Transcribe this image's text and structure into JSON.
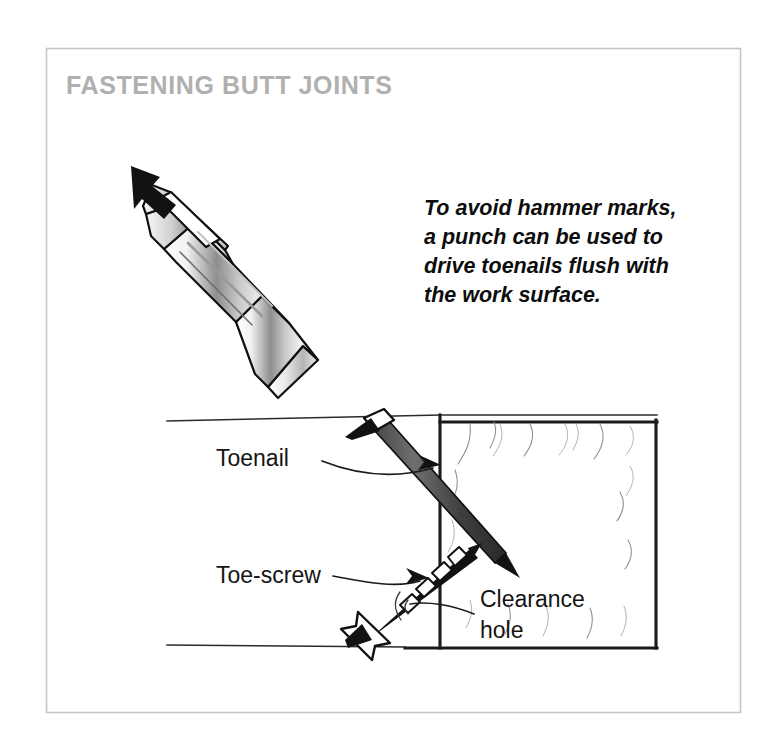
{
  "figure": {
    "title": "FASTENING BUTT JOINTS",
    "title_color": "#b0b0b0",
    "frame_color": "#c6c6c6",
    "background_color": "#ffffff",
    "ink_color": "#121212"
  },
  "caption": {
    "line1": "To avoid hammer marks,",
    "line2": "a punch can be used to",
    "line3": "drive toenails flush with",
    "line4": "the work surface."
  },
  "callouts": {
    "toenail": "Toenail",
    "toe_screw": "Toe-screw",
    "clearance_hole_line1": "Clearance",
    "clearance_hole_line2": "hole"
  },
  "icons": {
    "strike_arrow": "down-right-arrow-icon",
    "toenail_leader": "curved-leader-arrow-icon",
    "toe_screw_leader": "curved-leader-arrow-icon",
    "clearance_leader": "leader-line-icon"
  },
  "objects": {
    "nail_punch": "nail-punch-tool",
    "toenail_fastener": "toenail-fastener",
    "toe_screw_fastener": "toe-screw-fastener",
    "workpiece": "wood-butt-joint"
  }
}
